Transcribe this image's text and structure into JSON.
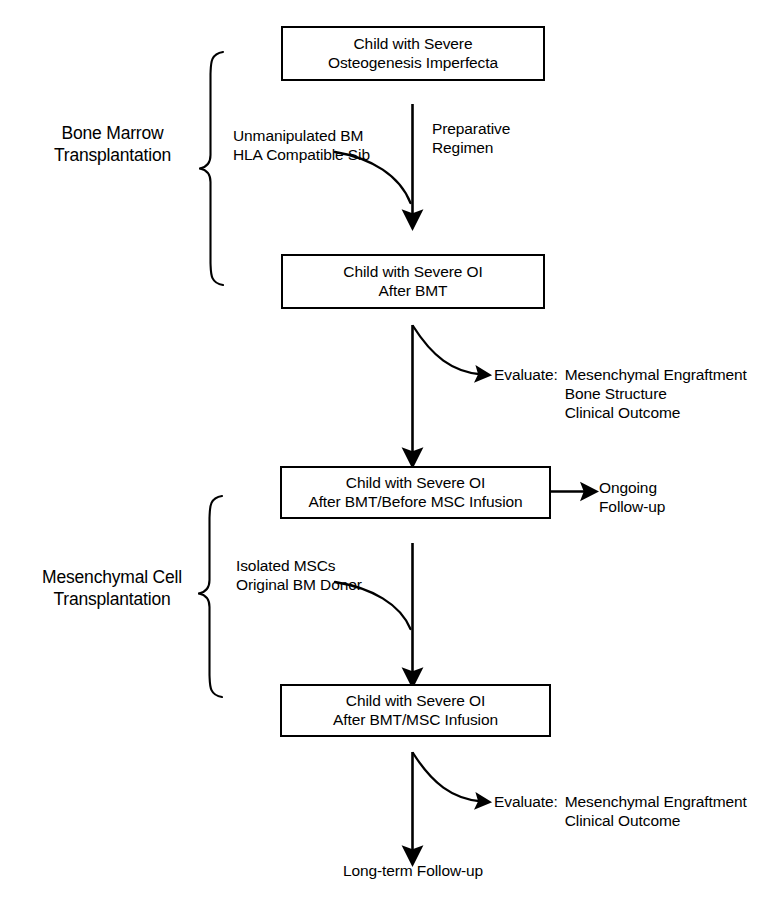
{
  "diagram": {
    "stroke_color": "#000000",
    "background_color": "#ffffff"
  },
  "groups": [
    {
      "id": "bmt",
      "label_line1": "Bone Marrow",
      "label_line2": "Transplantation"
    },
    {
      "id": "msc",
      "label_line1": "Mesenchymal Cell",
      "label_line2": "Transplantation"
    }
  ],
  "boxes": [
    {
      "id": "box1",
      "line1": "Child with Severe",
      "line2": "Osteogenesis Imperfecta"
    },
    {
      "id": "box2",
      "line1": "Child with Severe OI",
      "line2": "After BMT"
    },
    {
      "id": "box3",
      "line1": "Child with Severe OI",
      "line2": "After BMT/Before MSC Infusion"
    },
    {
      "id": "box4",
      "line1": "Child with Severe OI",
      "line2": "After BMT/MSC Infusion"
    }
  ],
  "edge_labels": {
    "preparative_regimen_line1": "Preparative",
    "preparative_regimen_line2": "Regimen",
    "donor_bm_line1": "Unmanipulated BM",
    "donor_bm_line2": "HLA Compatible Sib",
    "donor_msc_line1": "Isolated MSCs",
    "donor_msc_line2": "Original BM Donor"
  },
  "evaluations": [
    {
      "id": "eval1",
      "key": "Evaluate:",
      "items": [
        "Mesenchymal Engraftment",
        "Bone Structure",
        "Clinical Outcome"
      ]
    },
    {
      "id": "eval2",
      "key": "Evaluate:",
      "items": [
        "Mesenchymal Engraftment",
        "Clinical Outcome"
      ]
    }
  ],
  "side_outputs": {
    "ongoing_line1": "Ongoing",
    "ongoing_line2": "Follow-up"
  },
  "terminal": {
    "label": "Long-term Follow-up"
  }
}
